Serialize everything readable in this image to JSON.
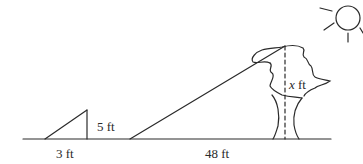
{
  "diagram": {
    "type": "similar-triangles-shadow-problem",
    "labels": {
      "small_height": "5 ft",
      "small_base": "3 ft",
      "large_base": "48 ft",
      "tree_height_var": "x",
      "tree_height_unit": " ft"
    },
    "elements": [
      "ground-line",
      "small-triangle",
      "sun-ray-line",
      "tree",
      "tree-height-dashed-line",
      "sun"
    ],
    "colors": {
      "stroke": "#2a2a2a",
      "background": "#ffffff"
    }
  }
}
